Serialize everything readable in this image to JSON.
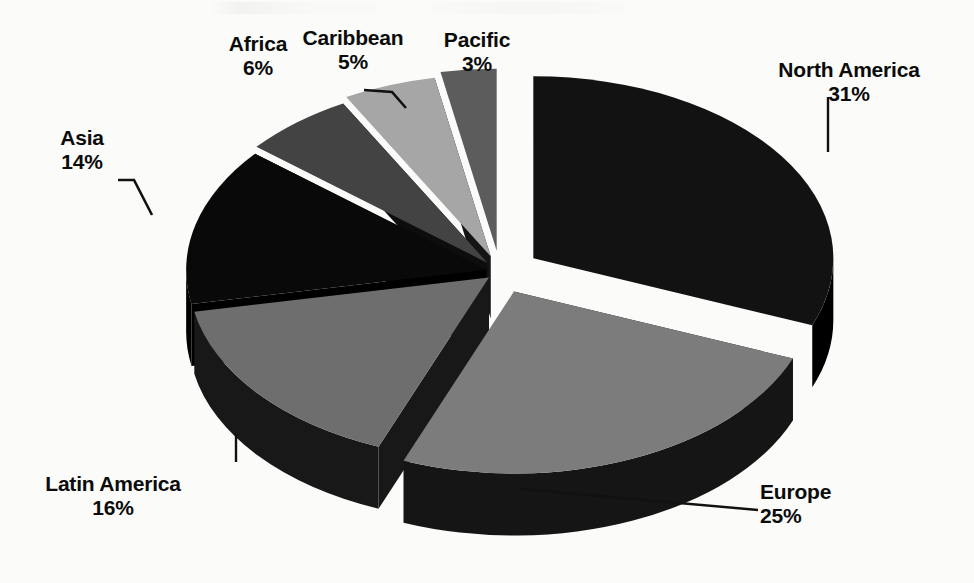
{
  "chart_data": {
    "type": "pie",
    "title": "",
    "subtitle": "",
    "xlabel": "",
    "ylabel": "",
    "style": "3d-exploded-pie",
    "grid": false,
    "legend_position": "none",
    "label_format": "name + percent",
    "total_percent": 100,
    "categories": [
      "North America",
      "Europe",
      "Latin America",
      "Asia",
      "Africa",
      "Caribbean",
      "Pacific"
    ],
    "values": [
      31,
      25,
      16,
      14,
      6,
      5,
      3
    ],
    "value_labels": [
      "31%",
      "25%",
      "16%",
      "14%",
      "6%",
      "5%",
      "3%"
    ],
    "slices": [
      {
        "name": "North America",
        "value": 31,
        "value_label": "31%",
        "color": "#121212",
        "side_color": "#000000",
        "leader": "vertical"
      },
      {
        "name": "Europe",
        "value": 25,
        "value_label": "25%",
        "color": "#7c7c7c",
        "side_color": "#151515",
        "leader": "diagonal"
      },
      {
        "name": "Latin America",
        "value": 16,
        "value_label": "16%",
        "color": "#6e6e6e",
        "side_color": "#181818",
        "leader": "vertical"
      },
      {
        "name": "Asia",
        "value": 14,
        "value_label": "14%",
        "color": "#090909",
        "side_color": "#000000",
        "leader": "elbow"
      },
      {
        "name": "Africa",
        "value": 6,
        "value_label": "6%",
        "color": "#434343",
        "side_color": "#0d0d0d",
        "leader": "none"
      },
      {
        "name": "Caribbean",
        "value": 5,
        "value_label": "5%",
        "color": "#a6a6a6",
        "side_color": "#141414",
        "leader": "elbow"
      },
      {
        "name": "Pacific",
        "value": 3,
        "value_label": "3%",
        "color": "#5c5c5c",
        "side_color": "#0a0a0a",
        "leader": "none"
      }
    ]
  },
  "colors": {
    "background": "#fbfbfa",
    "text": "#0b0b0b",
    "leader_line": "#111111"
  },
  "labels": {
    "north_america": {
      "name": "North America",
      "value": "31%"
    },
    "europe": {
      "name": "Europe",
      "value": "25%"
    },
    "latin_america": {
      "name": "Latin America",
      "value": "16%"
    },
    "asia": {
      "name": "Asia",
      "value": "14%"
    },
    "africa": {
      "name": "Africa",
      "value": "6%"
    },
    "caribbean": {
      "name": "Caribbean",
      "value": "5%"
    },
    "pacific": {
      "name": "Pacific",
      "value": "3%"
    }
  }
}
